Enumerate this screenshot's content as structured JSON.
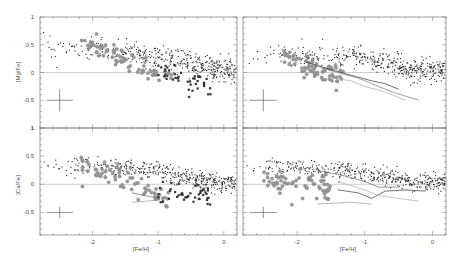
{
  "chart_data": {
    "type": "scatter",
    "layout": "2x2 panels, shared x axis per column, shared y axis per row",
    "xlabel": "[Fe/H]",
    "xlim": [
      -2.8,
      0.2
    ],
    "xticks": [
      -2,
      -1,
      0
    ],
    "xtick_labels": [
      "-2",
      "-1",
      "0"
    ],
    "grid": false,
    "reference_line_y": 0,
    "panels": [
      {
        "id": "top-left",
        "ylabel": "[Mg/Fe]",
        "ylim": [
          -1,
          1
        ],
        "yticks": [
          1,
          0.5,
          0,
          -0.5,
          -1
        ],
        "ytick_labels": [
          "1",
          "0.5",
          "0",
          "-0.5",
          "1"
        ],
        "series": [
          {
            "name": "field stars (small dots)",
            "marker": "dot",
            "trend": [
              [
                -2.8,
                0.45
              ],
              [
                -2.0,
                0.42
              ],
              [
                -1.5,
                0.35
              ],
              [
                -1.0,
                0.28
              ],
              [
                -0.6,
                0.2
              ],
              [
                -0.3,
                0.1
              ],
              [
                0.0,
                0.05
              ],
              [
                0.2,
                0.05
              ]
            ],
            "scatter": 0.1
          },
          {
            "name": "dwarf galaxy stars (grey circles)",
            "marker": "grey-circle",
            "trend": [
              [
                -2.2,
                0.55
              ],
              [
                -1.8,
                0.4
              ],
              [
                -1.5,
                0.25
              ],
              [
                -1.2,
                0.05
              ],
              [
                -1.0,
                -0.05
              ],
              [
                -0.8,
                -0.1
              ]
            ],
            "scatter": 0.1
          },
          {
            "name": "dwarf galaxy stars (dark squares)",
            "marker": "dark-square",
            "trend": [
              [
                -1.0,
                0.0
              ],
              [
                -0.7,
                -0.1
              ],
              [
                -0.4,
                -0.2
              ],
              [
                -0.2,
                -0.3
              ]
            ],
            "scatter": 0.1
          }
        ],
        "error_bar": {
          "x": -2.5,
          "y": -0.5,
          "xerr": 0.2,
          "yerr": 0.2
        }
      },
      {
        "id": "top-right",
        "ylabel": "",
        "ylim": [
          -1,
          1
        ],
        "series": [
          {
            "name": "field stars (small dots)",
            "marker": "dot",
            "trend": [
              [
                -2.8,
                0.35
              ],
              [
                -2.0,
                0.3
              ],
              [
                -1.5,
                0.28
              ],
              [
                -1.0,
                0.25
              ],
              [
                -0.6,
                0.15
              ],
              [
                -0.3,
                0.05
              ],
              [
                0.0,
                0.05
              ],
              [
                0.2,
                0.05
              ]
            ],
            "scatter": 0.1
          },
          {
            "name": "dwarf galaxy stars (grey circles)",
            "marker": "grey-circle",
            "trend": [
              [
                -2.2,
                0.3
              ],
              [
                -1.9,
                0.1
              ],
              [
                -1.6,
                0.0
              ],
              [
                -1.3,
                -0.1
              ]
            ],
            "scatter": 0.1
          }
        ],
        "model_lines": [
          {
            "name": "model 1",
            "color": "#333333",
            "points": [
              [
                -1.9,
                0.2
              ],
              [
                -1.5,
                0.05
              ],
              [
                -1.2,
                -0.05
              ],
              [
                -0.9,
                -0.15
              ],
              [
                -0.7,
                -0.2
              ],
              [
                -0.5,
                -0.3
              ]
            ]
          },
          {
            "name": "model 2",
            "color": "#777777",
            "points": [
              [
                -1.8,
                0.15
              ],
              [
                -1.4,
                0.0
              ],
              [
                -1.1,
                -0.1
              ],
              [
                -0.9,
                -0.2
              ],
              [
                -0.6,
                -0.35
              ],
              [
                -0.2,
                -0.5
              ]
            ]
          },
          {
            "name": "model 3",
            "color": "#aaaaaa",
            "points": [
              [
                -1.5,
                -0.1
              ],
              [
                -1.2,
                -0.15
              ],
              [
                -1.0,
                -0.25
              ],
              [
                -0.7,
                -0.35
              ],
              [
                -0.4,
                -0.5
              ]
            ]
          }
        ],
        "error_bar": {
          "x": -2.5,
          "y": -0.5,
          "xerr": 0.2,
          "yerr": 0.2
        }
      },
      {
        "id": "bottom-left",
        "ylabel": "[Ca/Fe]",
        "ylim": [
          -0.9,
          1
        ],
        "yticks": [
          1,
          0.5,
          0,
          -0.5
        ],
        "ytick_labels": [
          "1",
          "0.5",
          "0",
          "-0.5"
        ],
        "series": [
          {
            "name": "field stars (small dots)",
            "marker": "dot",
            "trend": [
              [
                -2.8,
                0.35
              ],
              [
                -2.0,
                0.33
              ],
              [
                -1.5,
                0.28
              ],
              [
                -1.0,
                0.22
              ],
              [
                -0.6,
                0.12
              ],
              [
                -0.3,
                0.05
              ],
              [
                0.0,
                0.02
              ],
              [
                0.2,
                0.02
              ]
            ],
            "scatter": 0.08
          },
          {
            "name": "dwarf galaxy stars (grey circles)",
            "marker": "grey-circle",
            "trend": [
              [
                -2.2,
                0.3
              ],
              [
                -1.8,
                0.25
              ],
              [
                -1.5,
                0.15
              ],
              [
                -1.2,
                -0.05
              ],
              [
                -1.0,
                -0.2
              ],
              [
                -0.8,
                -0.25
              ]
            ],
            "scatter": 0.1
          },
          {
            "name": "dwarf galaxy stars (dark squares)",
            "marker": "dark-square",
            "trend": [
              [
                -1.0,
                -0.2
              ],
              [
                -0.7,
                -0.15
              ],
              [
                -0.4,
                -0.2
              ],
              [
                -0.2,
                -0.25
              ]
            ],
            "scatter": 0.1
          }
        ],
        "model_lines": [
          {
            "name": "model 1",
            "color": "#666666",
            "points": [
              [
                -1.4,
                -0.15
              ],
              [
                -1.0,
                -0.25
              ]
            ]
          },
          {
            "name": "model 2",
            "color": "#999999",
            "points": [
              [
                -1.4,
                -0.32
              ],
              [
                -1.0,
                -0.28
              ]
            ]
          }
        ],
        "error_bar": {
          "x": -2.5,
          "y": -0.5,
          "xerr": 0.2,
          "yerr": 0.1
        }
      },
      {
        "id": "bottom-right",
        "ylabel": "",
        "ylim": [
          -0.9,
          1
        ],
        "series": [
          {
            "name": "field stars (small dots)",
            "marker": "dot",
            "trend": [
              [
                -2.8,
                0.35
              ],
              [
                -2.0,
                0.3
              ],
              [
                -1.5,
                0.25
              ],
              [
                -1.0,
                0.2
              ],
              [
                -0.6,
                0.12
              ],
              [
                -0.3,
                0.05
              ],
              [
                0.0,
                0.02
              ],
              [
                0.2,
                0.02
              ]
            ],
            "scatter": 0.08
          },
          {
            "name": "dwarf galaxy stars (grey circles)",
            "marker": "grey-circle",
            "trend": [
              [
                -2.5,
                0.05
              ],
              [
                -2.1,
                0.0
              ],
              [
                -1.8,
                -0.05
              ],
              [
                -1.5,
                -0.15
              ]
            ],
            "scatter": 0.12
          }
        ],
        "model_lines": [
          {
            "name": "model 1",
            "color": "#333333",
            "points": [
              [
                -1.4,
                -0.1
              ],
              [
                -1.1,
                -0.15
              ],
              [
                -0.9,
                -0.25
              ],
              [
                -0.7,
                -0.12
              ],
              [
                -0.4,
                -0.1
              ],
              [
                -0.1,
                -0.12
              ]
            ]
          },
          {
            "name": "model 2",
            "color": "#666666",
            "points": [
              [
                -1.7,
                0.25
              ],
              [
                -1.3,
                0.15
              ],
              [
                -1.0,
                0.05
              ],
              [
                -0.8,
                -0.05
              ],
              [
                -0.5,
                -0.05
              ]
            ]
          },
          {
            "name": "model 3",
            "color": "#aaaaaa",
            "points": [
              [
                -1.4,
                0.05
              ],
              [
                -1.0,
                -0.1
              ],
              [
                -0.8,
                -0.2
              ],
              [
                -0.5,
                -0.25
              ],
              [
                -0.2,
                -0.3
              ]
            ]
          },
          {
            "name": "model 4",
            "color": "#999999",
            "points": [
              [
                -1.7,
                -0.35
              ],
              [
                -1.2,
                -0.32
              ],
              [
                -0.9,
                -0.35
              ]
            ]
          }
        ],
        "error_bar": {
          "x": -2.5,
          "y": -0.5,
          "xerr": 0.2,
          "yerr": 0.1
        }
      }
    ]
  },
  "labels": {
    "top_left_ylabel": "[Mg/Fe]",
    "bottom_left_ylabel": "[Ca/Fe]",
    "xlabel_left": "[Fe/H]",
    "xlabel_right": "[Fe/H]"
  }
}
